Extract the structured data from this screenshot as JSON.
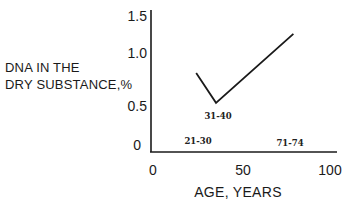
{
  "chart_data": {
    "type": "line",
    "title": "",
    "xlabel": "AGE, YEARS",
    "ylabel": "DNA IN THE DRY SUBSTANCE,%",
    "ylabel_lines": [
      "DNA IN THE",
      "DRY SUBSTANCE,%"
    ],
    "xlim": [
      0,
      100
    ],
    "ylim": [
      0,
      1.5
    ],
    "x_ticks": [
      "0",
      "50",
      "100"
    ],
    "y_ticks": [
      "1.5",
      "1.0",
      "0.5",
      "0"
    ],
    "grid": false,
    "legend": null,
    "series": [
      {
        "name": "DNA content",
        "x": [
          24,
          35,
          78
        ],
        "y": [
          0.81,
          0.53,
          1.26
        ],
        "color": "#1a1a1a"
      }
    ],
    "annotations": [
      {
        "text": "21-30",
        "x": 25,
        "y": 0.05
      },
      {
        "text": "31-40",
        "x": 36,
        "y": 0.42
      },
      {
        "text": "71-74",
        "x": 76,
        "y": 0.04
      }
    ]
  }
}
